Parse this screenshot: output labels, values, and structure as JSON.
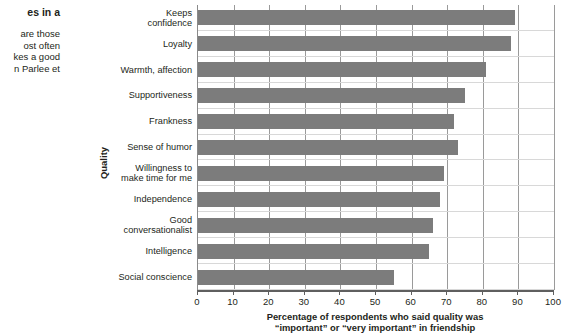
{
  "caption": {
    "heading": "es in a",
    "body": "are those\nost often\nkes a good\nn Parlee et"
  },
  "chart_data": {
    "type": "bar",
    "orientation": "horizontal",
    "title": "",
    "xlabel": "Percentage of respondents who said quality was\n“important” or “very important” in friendship",
    "xlabel_line1": "Percentage of respondents who said quality was",
    "xlabel_line2": "“important” or “very important” in friendship",
    "ylabel": "Quality",
    "categories": [
      "Keeps\nconfidence",
      "Loyalty",
      "Warmth, affection",
      "Supportiveness",
      "Frankness",
      "Sense of humor",
      "Willingness to\nmake time for me",
      "Independence",
      "Good\nconversationalist",
      "Intelligence",
      "Social conscience"
    ],
    "values": [
      89,
      88,
      81,
      75,
      72,
      73,
      69,
      68,
      66,
      65,
      55
    ],
    "xlim": [
      0,
      100
    ],
    "xticks": [
      0,
      10,
      20,
      30,
      40,
      50,
      60,
      70,
      80,
      90,
      100
    ],
    "xticklabels": [
      "0",
      "10",
      "20",
      "30",
      "40",
      "50",
      "60",
      "70",
      "80",
      "90",
      "100"
    ],
    "grid": "vertical",
    "legend": "none",
    "bar_color": "#7c7c7c",
    "axis_color": "#5f5f5f",
    "gridline_color": "#9a9a9a"
  }
}
